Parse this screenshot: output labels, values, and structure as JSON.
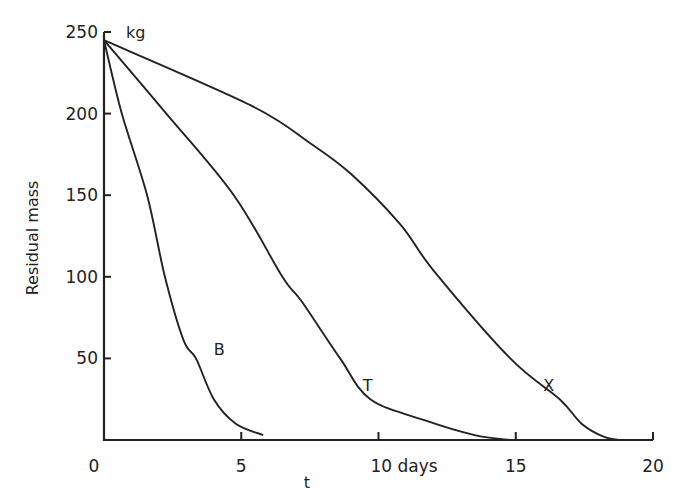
{
  "chart_data": {
    "type": "line",
    "title": "",
    "xlabel": "t",
    "ylabel": "Residual mass",
    "y_unit": "kg",
    "x_unit": "days",
    "xlim": [
      0,
      20
    ],
    "ylim": [
      0,
      250
    ],
    "x_ticks": [
      0,
      5,
      10,
      15,
      20
    ],
    "x_tick_labels": [
      "0",
      "5",
      "10 days",
      "15",
      "20"
    ],
    "y_ticks": [
      50,
      100,
      150,
      200,
      250
    ],
    "y_tick_labels": [
      "50",
      "100",
      "150",
      "200",
      "250"
    ],
    "grid": false,
    "legend": "inline labels",
    "series": [
      {
        "name": "B",
        "label_pos": [
          4.2,
          52
        ],
        "x": [
          0,
          0.65,
          1.57,
          2.22,
          2.9,
          3.35,
          4.0,
          4.8,
          5.8
        ],
        "y": [
          245,
          200,
          150,
          100,
          61,
          50,
          25,
          10,
          3
        ]
      },
      {
        "name": "T",
        "label_pos": [
          9.6,
          30
        ],
        "x": [
          0,
          2.27,
          4.73,
          6.5,
          7.2,
          8.6,
          9.7,
          11.7,
          13.5,
          14.8
        ],
        "y": [
          245,
          200,
          150,
          100,
          85,
          50,
          25,
          12,
          3,
          0
        ]
      },
      {
        "name": "X",
        "label_pos": [
          16.2,
          30
        ],
        "x": [
          0,
          5.35,
          7.5,
          9.0,
          10.8,
          12.0,
          14.8,
          16.6,
          17.4,
          18.2,
          18.8
        ],
        "y": [
          245,
          205,
          182,
          163,
          132,
          104,
          50,
          25,
          10,
          2,
          0
        ]
      }
    ]
  }
}
